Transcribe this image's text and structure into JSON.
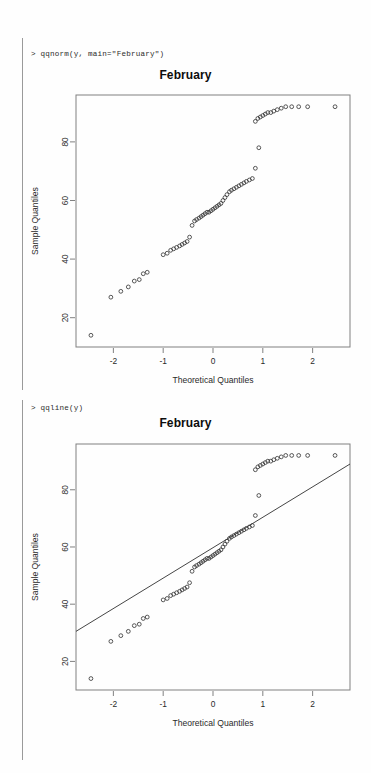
{
  "console": {
    "prompt_symbol": ">",
    "line_1": "> qqnorm(y, main=\"February\")",
    "line_2": "> qqline(y)"
  },
  "colors": {
    "background": "#fefefe",
    "frame": "#808080",
    "point": "#3a3a3a",
    "line": "#303030",
    "text": "#1a1a1a",
    "gutter": "#9a9a9a"
  },
  "plots": [
    {
      "name": "qqnorm-plot",
      "title": "February",
      "has_qqline": false
    },
    {
      "name": "qqline-plot",
      "title": "February",
      "has_qqline": true
    }
  ],
  "chart_data": [
    {
      "type": "scatter",
      "title": "February",
      "xlabel": "Theoretical Quantiles",
      "ylabel": "Sample Quantiles",
      "xlim": [
        -2.75,
        2.75
      ],
      "ylim": [
        10,
        96
      ],
      "xticks": [
        -2,
        -1,
        0,
        1,
        2
      ],
      "yticks": [
        20,
        40,
        60,
        80
      ],
      "grid": false,
      "legend": null,
      "point_marker": "open-circle",
      "qqline": null,
      "x": [
        -2.45,
        -2.05,
        -1.85,
        -1.7,
        -1.58,
        -1.48,
        -1.4,
        -1.32,
        -1.0,
        -0.92,
        -0.85,
        -0.79,
        -0.73,
        -0.67,
        -0.62,
        -0.57,
        -0.52,
        -0.47,
        -0.42,
        -0.37,
        -0.33,
        -0.28,
        -0.24,
        -0.2,
        -0.16,
        -0.12,
        -0.08,
        -0.04,
        0.0,
        0.04,
        0.08,
        0.12,
        0.16,
        0.2,
        0.24,
        0.28,
        0.33,
        0.37,
        0.42,
        0.47,
        0.52,
        0.57,
        0.62,
        0.67,
        0.73,
        0.79,
        0.85,
        0.92,
        0.85,
        0.9,
        0.95,
        1.0,
        1.05,
        1.1,
        1.16,
        1.22,
        1.29,
        1.37,
        1.46,
        1.58,
        1.72,
        1.9,
        2.45
      ],
      "y": [
        14.0,
        27.0,
        29.0,
        30.5,
        32.5,
        33.0,
        35.0,
        35.5,
        41.5,
        42.0,
        43.0,
        43.5,
        44.0,
        44.5,
        45.0,
        45.5,
        46.0,
        47.5,
        51.5,
        53.0,
        53.5,
        54.0,
        54.5,
        55.0,
        55.5,
        56.0,
        56.0,
        56.5,
        57.0,
        57.5,
        58.0,
        58.5,
        59.0,
        60.0,
        61.0,
        62.0,
        63.0,
        63.5,
        64.0,
        64.5,
        65.0,
        65.5,
        66.0,
        66.5,
        67.0,
        67.5,
        71.0,
        78.0,
        87.0,
        88.0,
        88.5,
        89.0,
        89.5,
        90.0,
        90.0,
        90.5,
        91.0,
        91.5,
        92.0,
        92.0,
        92.0,
        92.0,
        92.0
      ]
    },
    {
      "type": "scatter",
      "title": "February",
      "xlabel": "Theoretical Quantiles",
      "ylabel": "Sample Quantiles",
      "xlim": [
        -2.75,
        2.75
      ],
      "ylim": [
        10,
        96
      ],
      "xticks": [
        -2,
        -1,
        0,
        1,
        2
      ],
      "yticks": [
        20,
        40,
        60,
        80
      ],
      "grid": false,
      "legend": null,
      "point_marker": "open-circle",
      "qqline": {
        "x0": -2.75,
        "y0": 30.5,
        "x1": 2.75,
        "y1": 89.0,
        "slope": 10.64,
        "intercept": 59.75
      },
      "x": [
        -2.45,
        -2.05,
        -1.85,
        -1.7,
        -1.58,
        -1.48,
        -1.4,
        -1.32,
        -1.0,
        -0.92,
        -0.85,
        -0.79,
        -0.73,
        -0.67,
        -0.62,
        -0.57,
        -0.52,
        -0.47,
        -0.42,
        -0.37,
        -0.33,
        -0.28,
        -0.24,
        -0.2,
        -0.16,
        -0.12,
        -0.08,
        -0.04,
        0.0,
        0.04,
        0.08,
        0.12,
        0.16,
        0.2,
        0.24,
        0.28,
        0.33,
        0.37,
        0.42,
        0.47,
        0.52,
        0.57,
        0.62,
        0.67,
        0.73,
        0.79,
        0.85,
        0.92,
        0.85,
        0.9,
        0.95,
        1.0,
        1.05,
        1.1,
        1.16,
        1.22,
        1.29,
        1.37,
        1.46,
        1.58,
        1.72,
        1.9,
        2.45
      ],
      "y": [
        14.0,
        27.0,
        29.0,
        30.5,
        32.5,
        33.0,
        35.0,
        35.5,
        41.5,
        42.0,
        43.0,
        43.5,
        44.0,
        44.5,
        45.0,
        45.5,
        46.0,
        47.5,
        51.5,
        53.0,
        53.5,
        54.0,
        54.5,
        55.0,
        55.5,
        56.0,
        56.0,
        56.5,
        57.0,
        57.5,
        58.0,
        58.5,
        59.0,
        60.0,
        61.0,
        62.0,
        63.0,
        63.5,
        64.0,
        64.5,
        65.0,
        65.5,
        66.0,
        66.5,
        67.0,
        67.5,
        71.0,
        78.0,
        87.0,
        88.0,
        88.5,
        89.0,
        89.5,
        90.0,
        90.0,
        90.5,
        91.0,
        91.5,
        92.0,
        92.0,
        92.0,
        92.0,
        92.0
      ]
    }
  ]
}
